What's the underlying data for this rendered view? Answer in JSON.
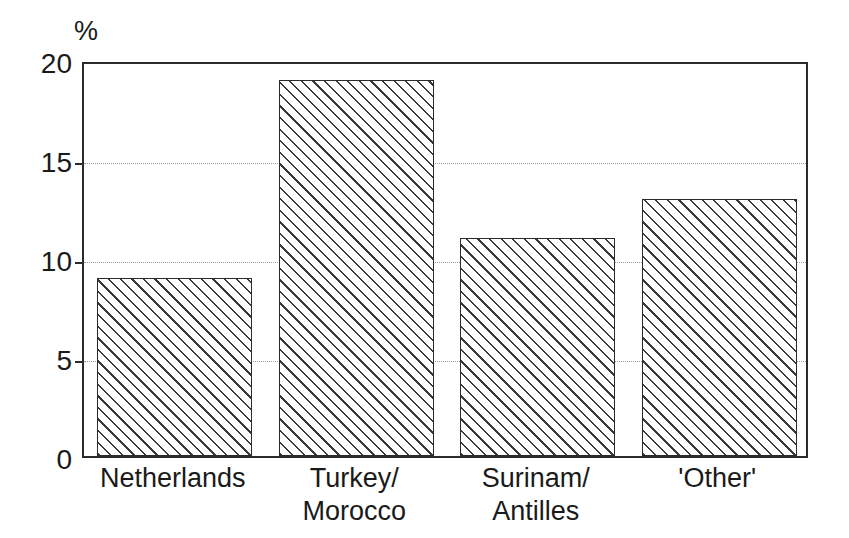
{
  "chart_data": {
    "type": "bar",
    "title": "",
    "subtitle": "",
    "xlabel": "",
    "ylabel": "%",
    "unit_label": "%",
    "categories": [
      "Netherlands",
      "Turkey/\nMorocco",
      "Surinam/\nAntilles",
      "'Other'"
    ],
    "category_lines": [
      [
        "Netherlands"
      ],
      [
        "Turkey/",
        "Morocco"
      ],
      [
        "Surinam/",
        "Antilles"
      ],
      [
        "'Other'"
      ]
    ],
    "values": [
      9,
      19,
      11,
      13
    ],
    "ylim": [
      0,
      20
    ],
    "yticks": [
      0,
      5,
      10,
      15,
      20
    ],
    "ytick_labels": [
      "0",
      "5",
      "10",
      "15",
      "20"
    ],
    "gridlines": [
      5,
      10,
      15
    ],
    "grid": true,
    "grid_style": "dotted",
    "legend": null,
    "legend_position": "none",
    "bar_fill": "diagonal-hatch",
    "colors": {
      "axis": "#2b2b2b",
      "bar_outline": "#2b2b2b",
      "hatch": "#3a3a3a",
      "bar_background": "#ffffff",
      "gridline": "#9a9a9a",
      "text": "#1a1a1a",
      "plot_background": "#ffffff"
    }
  }
}
